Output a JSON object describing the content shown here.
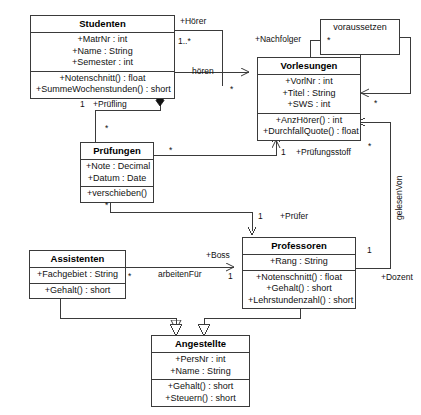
{
  "diagram": {
    "kind": "uml-class-diagram",
    "line_color": "#3a3a3a",
    "background_color": "#ffffff",
    "text_color": "#111111"
  },
  "classes": [
    {
      "id": "studenten",
      "name": "Studenten",
      "attributes": [
        "+MatrNr : int",
        "+Name : String",
        "+Semester : int"
      ],
      "operations": [
        "+Notenschnitt() : float",
        "+SummeWochenstunden() : short"
      ],
      "x": 30,
      "y": 15,
      "w": 145
    },
    {
      "id": "vorlesungen",
      "name": "Vorlesungen",
      "attributes": [
        "+VorlNr : int",
        "+Titel : String",
        "+SWS : int"
      ],
      "operations": [
        "+AnzHörer() : int",
        "+DurchfallQuote() : float"
      ],
      "x": 257,
      "y": 57,
      "w": 104
    },
    {
      "id": "pruefungen",
      "name": "Prüfungen",
      "attributes": [
        "+Note : Decimal",
        "+Datum : Date"
      ],
      "operations": [
        "+verschieben()"
      ],
      "x": 80,
      "y": 142,
      "w": 74
    },
    {
      "id": "assistenten",
      "name": "Assistenten",
      "attributes": [
        "+Fachgebiet : String"
      ],
      "operations": [
        "+Gehalt() : short"
      ],
      "x": 29,
      "y": 250,
      "w": 97
    },
    {
      "id": "professoren",
      "name": "Professoren",
      "attributes": [
        "+Rang : String"
      ],
      "operations": [
        "+Notenschnitt() : float",
        "+Gehalt() : short",
        "+Lehrstundenzahl() : short"
      ],
      "x": 242,
      "y": 237,
      "w": 114
    },
    {
      "id": "angestellte",
      "name": "Angestellte",
      "attributes": [
        "+PersNr : int",
        "+Name : String"
      ],
      "operations": [
        "+Gehalt() : short",
        "+Steuern() : short"
      ],
      "x": 151,
      "y": 335,
      "w": 99
    }
  ],
  "association_classes": [
    {
      "id": "voraussetzen",
      "name": "voraussetzen",
      "multiplicity": "*",
      "x": 320,
      "y": 19,
      "w": 80,
      "h": 36
    }
  ],
  "edge_labels": [
    {
      "id": "hoerer-role",
      "text": "+Hörer",
      "x": 180,
      "y": 16
    },
    {
      "id": "hoerer-mult",
      "text": "1..*",
      "x": 178,
      "y": 36
    },
    {
      "id": "nachfolger-role",
      "text": "+Nachfolger",
      "x": 255,
      "y": 34
    },
    {
      "id": "hoeren-name",
      "text": "hören",
      "x": 192,
      "y": 66
    },
    {
      "id": "hoeren-mult",
      "text": "*",
      "x": 230,
      "y": 84
    },
    {
      "id": "pruefling-mult",
      "text": "1",
      "x": 80,
      "y": 99
    },
    {
      "id": "pruefling-role",
      "text": "+Prüfling",
      "x": 93,
      "y": 99
    },
    {
      "id": "pruefungen-mult-1",
      "text": "*",
      "x": 105,
      "y": 123
    },
    {
      "id": "vorlesung-mult-1",
      "text": "*",
      "x": 169,
      "y": 145
    },
    {
      "id": "pruefungsstoff-m",
      "text": "1",
      "x": 281,
      "y": 147
    },
    {
      "id": "pruefungsstoff-r",
      "text": "+Prüfungsstoff",
      "x": 296,
      "y": 147
    },
    {
      "id": "pruefungen-mult-2",
      "text": "*",
      "x": 105,
      "y": 200
    },
    {
      "id": "pruefer-mult",
      "text": "1",
      "x": 258,
      "y": 211
    },
    {
      "id": "pruefer-role",
      "text": "+Prüfer",
      "x": 280,
      "y": 211
    },
    {
      "id": "boss-role",
      "text": "+Boss",
      "x": 206,
      "y": 250
    },
    {
      "id": "arbeitenfuer-name",
      "text": "arbeitenFür",
      "x": 158,
      "y": 269
    },
    {
      "id": "arbeitenfuer-mult-1",
      "text": "*",
      "x": 128,
      "y": 271
    },
    {
      "id": "arbeitenfuer-mult-2",
      "text": "1",
      "x": 228,
      "y": 271
    },
    {
      "id": "gelesenvon-mult",
      "text": "1",
      "x": 367,
      "y": 245
    },
    {
      "id": "dozent-role",
      "text": "+Dozent",
      "x": 381,
      "y": 272
    },
    {
      "id": "vorlesungen-mult-r",
      "text": "*",
      "x": 368,
      "y": 141
    },
    {
      "id": "voraussetzen-mult",
      "text": "*",
      "x": 374,
      "y": 98
    }
  ],
  "vertical_labels": [
    {
      "id": "gelesenvon-name",
      "text": "gelesenVon",
      "x": 394,
      "y": 220
    }
  ]
}
